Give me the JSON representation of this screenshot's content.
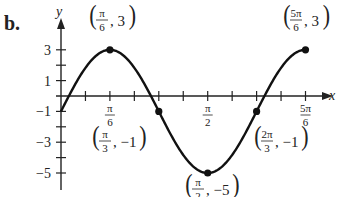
{
  "part_label": "b.",
  "chart_data": {
    "type": "line",
    "title": "",
    "function": "y = 4 sin(3x) - 1",
    "xlabel": "x",
    "ylabel": "y",
    "xlim": [
      0,
      2.618
    ],
    "ylim": [
      -5,
      3
    ],
    "grid": false,
    "x_tick_labels": [
      {
        "num": "π",
        "den": "6",
        "value": 0.5236
      },
      {
        "num": "π",
        "den": "2",
        "value": 1.5708
      },
      {
        "num": "5π",
        "den": "6",
        "value": 2.618
      }
    ],
    "y_tick_labels": [
      "3",
      "1",
      "-1",
      "-3",
      "-5"
    ],
    "y_ticks": [
      3,
      2,
      1,
      0,
      -1,
      -2,
      -3,
      -4,
      -5
    ],
    "x_tick_step": "π/12",
    "series": [
      {
        "name": "curve",
        "x": [
          0,
          0.5236,
          1.0472,
          1.5708,
          2.0944,
          2.618
        ],
        "y": [
          -1,
          3,
          -1,
          -5,
          -1,
          3
        ]
      }
    ],
    "annotations": [
      {
        "label_num": "π",
        "label_den": "6",
        "y": "3",
        "point": [
          0.5236,
          3
        ]
      },
      {
        "label_num": "π",
        "label_den": "3",
        "y": "−1",
        "point": [
          1.0472,
          -1
        ]
      },
      {
        "label_num": "π",
        "label_den": "2",
        "y": "−5",
        "point": [
          1.5708,
          -5
        ]
      },
      {
        "label_num": "2π",
        "label_den": "3",
        "y": "−1",
        "point": [
          2.0944,
          -1
        ]
      },
      {
        "label_num": "5π",
        "label_den": "6",
        "y": "3",
        "point": [
          2.618,
          3
        ]
      }
    ]
  }
}
